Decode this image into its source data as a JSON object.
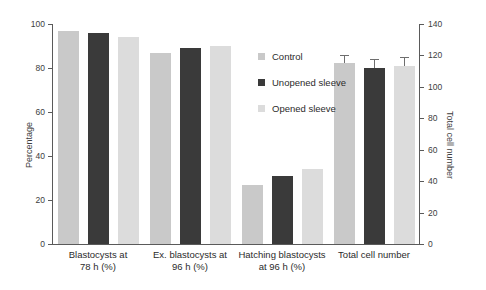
{
  "chart_data": {
    "type": "bar",
    "title": "",
    "categories": [
      "Blastocysts at\n78 h (%)",
      "Ex. blastocysts at\n96 h (%)",
      "Hatching blastocysts\nat 96 h (%)",
      "Total cell number"
    ],
    "series": [
      {
        "name": "Control",
        "color": "#c9c9c9",
        "values": [
          97,
          87,
          27,
          115
        ]
      },
      {
        "name": "Unopened sleeve",
        "color": "#3a3a3a",
        "values": [
          96,
          89,
          31,
          112
        ]
      },
      {
        "name": "Opened sleeve",
        "color": "#dcdcdc",
        "values": [
          94,
          90,
          34,
          113
        ]
      }
    ],
    "errors": {
      "Total cell number": [
        {
          "series": "Control",
          "value": 115,
          "err": 5
        },
        {
          "series": "Unopened sleeve",
          "value": 112,
          "err": 6
        },
        {
          "series": "Opened sleeve",
          "value": 113,
          "err": 6
        }
      ]
    },
    "xlabel": "",
    "ylabel": "Percentage",
    "ylabel_secondary": "Total cell number",
    "ylim": [
      0,
      100
    ],
    "ylim_secondary": [
      0,
      140
    ],
    "yticks": [
      0,
      20,
      40,
      60,
      80,
      100
    ],
    "yticks_secondary": [
      0,
      20,
      40,
      60,
      80,
      100,
      120,
      140
    ],
    "grid": false,
    "legend_position": "upper-center",
    "secondary_axis_categories": [
      "Total cell number"
    ]
  },
  "axes": {
    "left": {
      "title": "Percentage",
      "ticks": [
        "0",
        "20",
        "40",
        "60",
        "80",
        "100"
      ]
    },
    "right": {
      "title": "Total cell number",
      "ticks": [
        "0",
        "20",
        "40",
        "60",
        "80",
        "100",
        "120",
        "140"
      ]
    }
  },
  "legend": {
    "items": [
      {
        "label": "Control",
        "color": "#c9c9c9"
      },
      {
        "label": "Unopened sleeve",
        "color": "#3a3a3a"
      },
      {
        "label": "Opened sleeve",
        "color": "#dcdcdc"
      }
    ]
  },
  "categories": [
    {
      "line1": "Blastocysts at",
      "line2": "78 h (%)"
    },
    {
      "line1": "Ex. blastocysts at",
      "line2": "96 h (%)"
    },
    {
      "line1": "Hatching blastocysts",
      "line2": "at 96 h (%)"
    },
    {
      "line1": "Total cell number",
      "line2": ""
    }
  ]
}
